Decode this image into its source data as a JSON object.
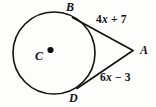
{
  "figure": {
    "type": "geometry-diagram",
    "background_color": "#fdfdfc",
    "stroke_color": "#111111",
    "points": {
      "center": {
        "label": "C"
      },
      "tangent_top": {
        "label": "B"
      },
      "tangent_bottom": {
        "label": "D"
      },
      "external_vertex": {
        "label": "A"
      }
    },
    "segments": [
      {
        "name": "segment-BA",
        "label": "4x + 7",
        "coefficient": "4",
        "variable": "x",
        "operator": "+",
        "constant": "7"
      },
      {
        "name": "segment-DA",
        "label": "6x - 3",
        "coefficient": "6",
        "variable": "x",
        "operator": "−",
        "constant": "3"
      }
    ],
    "labels": {
      "B": "B",
      "A": "A",
      "D": "D",
      "C": "C",
      "top_expression_prefix": "4",
      "top_expression_var": "x",
      "top_expression_suffix": " + 7",
      "bottom_expression_prefix": "6",
      "bottom_expression_var": "x",
      "bottom_expression_suffix": " − 3"
    }
  }
}
